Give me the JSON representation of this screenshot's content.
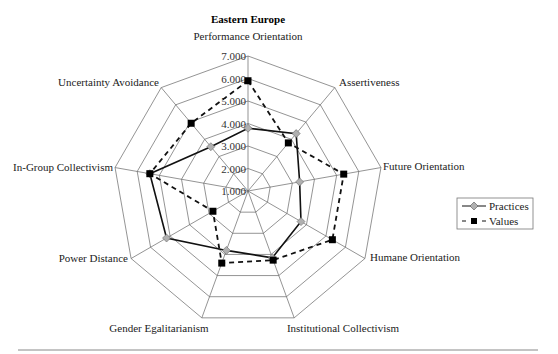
{
  "chart_data": {
    "type": "radar",
    "title": "Eastern Europe",
    "categories": [
      "Performance Orientation",
      "Assertiveness",
      "Future Orientation",
      "Humane Orientation",
      "Institutional Collectivism",
      "Gender Egalitarianism",
      "Power Distance",
      "In-Group Collectivism",
      "Uncertainty Avoidance"
    ],
    "series": [
      {
        "name": "Practices",
        "line_style": "solid",
        "marker": "diamond",
        "marker_color": "#b0b0b0",
        "line_color": "#111111",
        "values": [
          3.79,
          4.33,
          3.33,
          3.72,
          4.16,
          3.81,
          5.18,
          5.43,
          3.57
        ]
      },
      {
        "name": "Values",
        "line_style": "dashed",
        "marker": "square",
        "marker_color": "#000000",
        "line_color": "#111111",
        "values": [
          5.9,
          3.79,
          5.32,
          5.33,
          4.27,
          4.41,
          2.8,
          5.43,
          4.93
        ]
      }
    ],
    "rlim": [
      1.0,
      7.0
    ],
    "ticks": [
      "1.000",
      "2.000",
      "3.000",
      "4.000",
      "5.000",
      "6.000",
      "7.000"
    ],
    "grid": true,
    "legend_position": "right"
  },
  "legend": {
    "items": [
      {
        "label": "Practices"
      },
      {
        "label": "Values"
      }
    ]
  }
}
